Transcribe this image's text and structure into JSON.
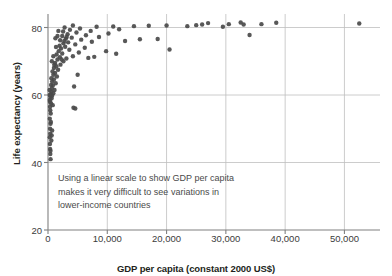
{
  "chart_data": {
    "type": "scatter",
    "title": "",
    "xlabel": "GDP per capita (constant 2000 US$)",
    "ylabel": "Life expectancy (years)",
    "xlim": [
      0,
      56000
    ],
    "ylim": [
      20,
      84
    ],
    "xticks": [
      0,
      10000,
      20000,
      30000,
      40000,
      50000
    ],
    "xticklabels": [
      "0",
      "10,000",
      "20,000",
      "30,000",
      "40,000",
      "50,000"
    ],
    "yticks": [
      20,
      40,
      60,
      80
    ],
    "yticklabels": [
      "20",
      "40",
      "60",
      "80"
    ],
    "grid": true,
    "grid_color": "#bfbfbf",
    "axis_color": "#808080",
    "marker_color": "#4a4a4a",
    "marker_size": 4.4,
    "legend": null,
    "annotations": [
      {
        "name": "linear-scale-note",
        "text": "Using a linear scale to show GDP per capita\nmakes it very difficult to see variations in\nlower-income countries",
        "x": 1800,
        "y": 36
      }
    ],
    "points": [
      {
        "x": 330,
        "y": 45.5
      },
      {
        "x": 360,
        "y": 44.0
      },
      {
        "x": 420,
        "y": 43.5
      },
      {
        "x": 300,
        "y": 47.5
      },
      {
        "x": 380,
        "y": 48.5
      },
      {
        "x": 350,
        "y": 50.0
      },
      {
        "x": 420,
        "y": 51.5
      },
      {
        "x": 300,
        "y": 53.0
      },
      {
        "x": 460,
        "y": 54.5
      },
      {
        "x": 380,
        "y": 55.5
      },
      {
        "x": 340,
        "y": 56.5
      },
      {
        "x": 520,
        "y": 57.5
      },
      {
        "x": 300,
        "y": 58.5
      },
      {
        "x": 600,
        "y": 59.0
      },
      {
        "x": 400,
        "y": 59.5
      },
      {
        "x": 700,
        "y": 59.8
      },
      {
        "x": 480,
        "y": 60.2
      },
      {
        "x": 900,
        "y": 60.5
      },
      {
        "x": 560,
        "y": 61.0
      },
      {
        "x": 1100,
        "y": 61.5
      },
      {
        "x": 640,
        "y": 62.0
      },
      {
        "x": 820,
        "y": 62.8
      },
      {
        "x": 1300,
        "y": 63.5
      },
      {
        "x": 700,
        "y": 64.0
      },
      {
        "x": 1000,
        "y": 64.6
      },
      {
        "x": 560,
        "y": 65.0
      },
      {
        "x": 1500,
        "y": 65.5
      },
      {
        "x": 900,
        "y": 66.0
      },
      {
        "x": 1200,
        "y": 66.5
      },
      {
        "x": 760,
        "y": 67.0
      },
      {
        "x": 1700,
        "y": 67.5
      },
      {
        "x": 1000,
        "y": 68.0
      },
      {
        "x": 1400,
        "y": 68.5
      },
      {
        "x": 2100,
        "y": 69.0
      },
      {
        "x": 1200,
        "y": 69.5
      },
      {
        "x": 2600,
        "y": 70.0
      },
      {
        "x": 1600,
        "y": 70.5
      },
      {
        "x": 3100,
        "y": 70.8
      },
      {
        "x": 2000,
        "y": 71.2
      },
      {
        "x": 4200,
        "y": 71.5
      },
      {
        "x": 1450,
        "y": 72.0
      },
      {
        "x": 2400,
        "y": 72.3
      },
      {
        "x": 5200,
        "y": 72.6
      },
      {
        "x": 1800,
        "y": 73.0
      },
      {
        "x": 3600,
        "y": 73.4
      },
      {
        "x": 2200,
        "y": 73.8
      },
      {
        "x": 6200,
        "y": 74.0
      },
      {
        "x": 2900,
        "y": 74.3
      },
      {
        "x": 1950,
        "y": 74.6
      },
      {
        "x": 4600,
        "y": 75.0
      },
      {
        "x": 2600,
        "y": 75.3
      },
      {
        "x": 3400,
        "y": 75.6
      },
      {
        "x": 7400,
        "y": 75.8
      },
      {
        "x": 2050,
        "y": 76.2
      },
      {
        "x": 5600,
        "y": 76.4
      },
      {
        "x": 3000,
        "y": 76.7
      },
      {
        "x": 4000,
        "y": 77.0
      },
      {
        "x": 8600,
        "y": 77.2
      },
      {
        "x": 2400,
        "y": 77.5
      },
      {
        "x": 6400,
        "y": 77.7
      },
      {
        "x": 3300,
        "y": 78.0
      },
      {
        "x": 10200,
        "y": 78.2
      },
      {
        "x": 4800,
        "y": 78.5
      },
      {
        "x": 2550,
        "y": 78.8
      },
      {
        "x": 7200,
        "y": 79.0
      },
      {
        "x": 3700,
        "y": 79.3
      },
      {
        "x": 12000,
        "y": 79.5
      },
      {
        "x": 5400,
        "y": 79.7
      },
      {
        "x": 2800,
        "y": 80.0
      },
      {
        "x": 8200,
        "y": 80.2
      },
      {
        "x": 14500,
        "y": 80.4
      },
      {
        "x": 4200,
        "y": 80.6
      },
      {
        "x": 17000,
        "y": 80.5
      },
      {
        "x": 11000,
        "y": 80.3
      },
      {
        "x": 20000,
        "y": 80.6
      },
      {
        "x": 23500,
        "y": 80.4
      },
      {
        "x": 26000,
        "y": 80.9
      },
      {
        "x": 27000,
        "y": 81.3
      },
      {
        "x": 29500,
        "y": 80.2
      },
      {
        "x": 32500,
        "y": 81.5
      },
      {
        "x": 33000,
        "y": 80.9
      },
      {
        "x": 38500,
        "y": 81.4
      },
      {
        "x": 52500,
        "y": 81.2
      },
      {
        "x": 15500,
        "y": 76.5
      },
      {
        "x": 13000,
        "y": 76.0
      },
      {
        "x": 18500,
        "y": 76.6
      },
      {
        "x": 20500,
        "y": 73.5
      },
      {
        "x": 34000,
        "y": 77.8
      },
      {
        "x": 9800,
        "y": 73.0
      },
      {
        "x": 11500,
        "y": 72.2
      },
      {
        "x": 6800,
        "y": 71.0
      },
      {
        "x": 7800,
        "y": 71.3
      },
      {
        "x": 5000,
        "y": 66.0
      },
      {
        "x": 4400,
        "y": 62.5
      },
      {
        "x": 4300,
        "y": 56.2
      },
      {
        "x": 4600,
        "y": 56.0
      },
      {
        "x": 1600,
        "y": 77.5
      },
      {
        "x": 2750,
        "y": 76.0
      },
      {
        "x": 3150,
        "y": 77.2
      },
      {
        "x": 2300,
        "y": 70.5
      },
      {
        "x": 1250,
        "y": 76.8
      },
      {
        "x": 1350,
        "y": 74.2
      },
      {
        "x": 900,
        "y": 71.5
      },
      {
        "x": 650,
        "y": 70.0
      },
      {
        "x": 1050,
        "y": 69.0
      },
      {
        "x": 800,
        "y": 57.0
      },
      {
        "x": 480,
        "y": 52.0
      },
      {
        "x": 560,
        "y": 46.5
      },
      {
        "x": 620,
        "y": 48.0
      },
      {
        "x": 700,
        "y": 49.5
      },
      {
        "x": 430,
        "y": 41.0
      },
      {
        "x": 390,
        "y": 42.5
      },
      {
        "x": 330,
        "y": 58.0
      },
      {
        "x": 300,
        "y": 60.0
      },
      {
        "x": 270,
        "y": 61.5
      },
      {
        "x": 520,
        "y": 63.0
      },
      {
        "x": 1750,
        "y": 79.0
      },
      {
        "x": 25000,
        "y": 80.7
      },
      {
        "x": 30500,
        "y": 81.0
      },
      {
        "x": 36000,
        "y": 81.0
      }
    ]
  },
  "axes": {
    "x_title": "GDP per capita (constant 2000 US$)",
    "y_title": "Life expectancy (years)"
  }
}
